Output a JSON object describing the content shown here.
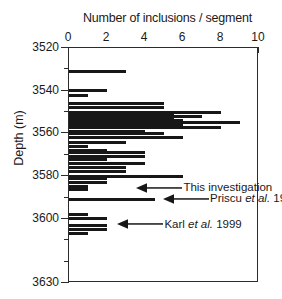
{
  "chart_data": {
    "type": "bar",
    "orientation": "horizontal",
    "title": "Number of inclusions / segment",
    "xlabel": "Number of inclusions / segment",
    "ylabel": "Depth (m)",
    "xlim": [
      0,
      10
    ],
    "ylim": [
      3630,
      3520
    ],
    "y_inverted": true,
    "grid": false,
    "legend": "none",
    "xticks": [
      0,
      2,
      4,
      6,
      8,
      10
    ],
    "xticklabels": [
      "0",
      "2",
      "4",
      "6",
      "8",
      "10"
    ],
    "xminor_ticks": [
      1,
      3,
      5,
      7,
      9
    ],
    "yticks": [
      3520,
      3540,
      3560,
      3580,
      3600,
      3630
    ],
    "yticklabels": [
      "3520",
      "3540",
      "3560",
      "3580",
      "3600",
      "3630"
    ],
    "yminor_ticks": [
      3530,
      3550,
      3570,
      3590,
      3610,
      3620
    ],
    "bar_color": "#171717",
    "categories": [
      3531,
      3540,
      3542,
      3546,
      3548,
      3550,
      3551,
      3552,
      3553,
      3554,
      3555,
      3556,
      3557,
      3559,
      3560,
      3562,
      3564,
      3566,
      3568,
      3569,
      3571,
      3572,
      3574,
      3576,
      3578,
      3580,
      3581,
      3583,
      3585,
      3586,
      3591,
      3598,
      3600,
      3603,
      3605,
      3607
    ],
    "values": [
      3.0,
      2.0,
      1.0,
      5.0,
      5.0,
      8.0,
      5.5,
      7.0,
      5.5,
      6.0,
      9.0,
      6.0,
      8.0,
      4.0,
      5.0,
      6.0,
      3.0,
      1.0,
      2.0,
      4.0,
      4.0,
      2.0,
      4.0,
      3.0,
      3.0,
      6.0,
      2.0,
      2.0,
      1.0,
      1.0,
      4.5,
      1.0,
      2.0,
      2.0,
      2.0,
      1.0
    ],
    "annotations": [
      {
        "label": "This investigation",
        "label_parts": [
          {
            "text": "This investigation",
            "italic": false
          }
        ],
        "target_depth": 3586,
        "target_value": 3.6
      },
      {
        "label": "Priscu et al. 1999",
        "label_parts": [
          {
            "text": "Priscu ",
            "italic": false
          },
          {
            "text": "et al.",
            "italic": true
          },
          {
            "text": " 1999",
            "italic": false
          }
        ],
        "target_depth": 3591,
        "target_value": 5.0
      },
      {
        "label": "Karl et al. 1999",
        "label_parts": [
          {
            "text": "Karl ",
            "italic": false
          },
          {
            "text": "et al.",
            "italic": true
          },
          {
            "text": " 1999",
            "italic": false
          }
        ],
        "target_depth": 3603,
        "target_value": 2.6
      }
    ]
  }
}
